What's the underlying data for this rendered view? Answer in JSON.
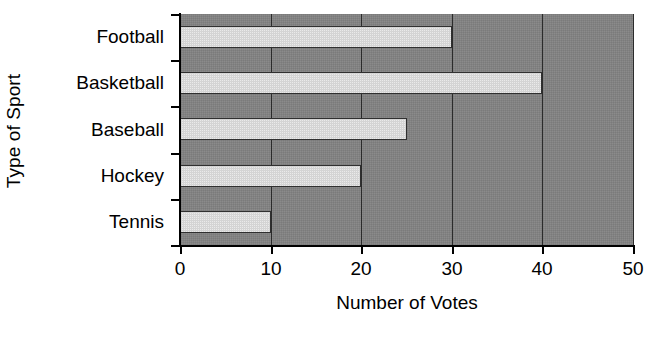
{
  "chart_data": {
    "type": "bar",
    "orientation": "horizontal",
    "title": "",
    "xlabel": "Number of Votes",
    "ylabel": "Type of Sport",
    "categories": [
      "Football",
      "Basketball",
      "Baseball",
      "Hockey",
      "Tennis"
    ],
    "values": [
      30,
      40,
      25,
      20,
      10
    ],
    "xlim": [
      0,
      50
    ],
    "xticks": [
      0,
      10,
      20,
      30,
      40,
      50
    ],
    "xtick_labels": [
      "0",
      "10",
      "20",
      "30",
      "40",
      "50"
    ],
    "grid": true,
    "grid_axis": "x",
    "legend": false,
    "legend_position": "none",
    "series": [
      {
        "name": "Number of Votes",
        "values": [
          30,
          40,
          25,
          20,
          10
        ]
      }
    ],
    "colors": {
      "bar_fill": "#d4d4d4",
      "bar_edge": "#303030",
      "plot_background": "#828282",
      "gridline": "#2b2b2b",
      "axis": "#000000",
      "text": "#000000",
      "figure_background": "#ffffff"
    }
  }
}
